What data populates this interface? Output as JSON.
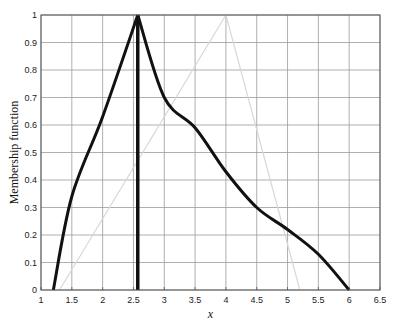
{
  "chart_data": {
    "type": "line",
    "title": "",
    "xlabel": "x",
    "ylabel": "Membership function",
    "xlim": [
      1,
      6.5
    ],
    "ylim": [
      0,
      1
    ],
    "xticks": [
      1,
      1.5,
      2,
      2.5,
      3,
      3.5,
      4,
      4.5,
      5,
      5.5,
      6,
      6.5
    ],
    "xtick_labels": [
      "1",
      "1.5",
      "2",
      "2.5",
      "3",
      "3.5",
      "4",
      "4.5",
      "5",
      "5.5",
      "6",
      "6.5"
    ],
    "yticks": [
      0,
      0.1,
      0.2,
      0.3,
      0.4,
      0.5,
      0.6,
      0.7,
      0.8,
      0.9,
      1
    ],
    "ytick_labels": [
      "0",
      "0.1",
      "0.2",
      "0.3",
      "0.4",
      "0.5",
      "0.6",
      "0.7",
      "0.8",
      "0.9",
      "1"
    ],
    "grid": true,
    "legend": null,
    "series": [
      {
        "name": "membership-curve",
        "style": "thick black",
        "x": [
          1.2,
          1.5,
          2.0,
          2.57,
          3.0,
          3.5,
          4.0,
          4.5,
          5.0,
          5.5,
          6.0
        ],
        "y": [
          0.0,
          0.34,
          0.63,
          1.0,
          0.7,
          0.59,
          0.43,
          0.3,
          0.22,
          0.13,
          0.0
        ]
      },
      {
        "name": "vertical-marker",
        "style": "thick black vertical",
        "x": [
          2.57,
          2.57
        ],
        "y": [
          0,
          1
        ]
      },
      {
        "name": "faint-triangle",
        "style": "faint gray",
        "x": [
          1.3,
          4.0,
          5.2
        ],
        "y": [
          0.0,
          1.0,
          0.0
        ]
      }
    ]
  },
  "colors": {
    "curve": "#111111",
    "grid": "#9a9a9a",
    "faint": "#d8d8d8",
    "axis": "#555555"
  }
}
